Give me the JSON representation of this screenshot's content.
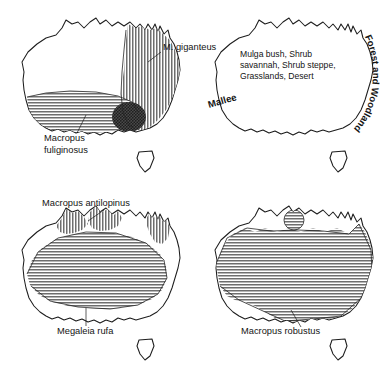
{
  "figure": {
    "background_color": "#ffffff",
    "ink_color": "#1d1d1d",
    "panel_count": 4
  },
  "panels": [
    {
      "id": "kangaroo-east-west",
      "position": "top-left",
      "labels": [
        {
          "name": "m-giganteus",
          "text": "M. giganteus",
          "lines": [
            "M. giganteus"
          ],
          "x": 163,
          "y": 50,
          "anchor": "start",
          "leader": true
        },
        {
          "name": "macropus-fuliginosus",
          "text": "Macropus fuliginosus",
          "lines": [
            "Macropus",
            "fuliginosus"
          ],
          "x": 44,
          "y": 141,
          "anchor": "start",
          "leader": true
        }
      ],
      "regions": [
        {
          "name": "giganteus-range",
          "pattern": "vertical-hatch",
          "color": "#6e6e6e"
        },
        {
          "name": "fuliginosus-range",
          "pattern": "horizontal-hatch",
          "color": "#6e6e6e"
        },
        {
          "name": "range-overlap-blob",
          "pattern": "dark-stipple",
          "color": "#3a3a3a"
        }
      ]
    },
    {
      "id": "vegetation",
      "position": "top-right",
      "labels": [
        {
          "name": "arid-zone-vegetation",
          "text": "Mulga bush, Shrub savannah, Shrub steppe, Grasslands, Desert",
          "lines": [
            "Mulga bush, Shrub",
            "savannah, Shrub steppe,",
            "Grasslands, Desert"
          ],
          "x": 47,
          "y": 57,
          "anchor": "start",
          "leader": false
        },
        {
          "name": "mallee",
          "text": "Mallee",
          "lines": [
            "Mallee"
          ],
          "x": 16,
          "y": 108,
          "anchor": "start",
          "rotate": -16,
          "leader": false
        },
        {
          "name": "forest-and-woodland",
          "text": "Forest and Woodland",
          "lines": [
            "Forest and Woodland"
          ],
          "curved": true,
          "leader": false
        }
      ],
      "regions": [
        {
          "name": "arid-interior",
          "pattern": "white",
          "color": "#ffffff"
        },
        {
          "name": "forest-woodland-belt",
          "pattern": "light-gray",
          "color": "#d7d7d7"
        },
        {
          "name": "mallee-belt",
          "pattern": "mid-gray",
          "color": "#b4b4b4"
        }
      ]
    },
    {
      "id": "antilopinus-rufa",
      "position": "bottom-left",
      "labels": [
        {
          "name": "macropus-antilopinus",
          "text": "Macropus antilopinus",
          "lines": [
            "Macropus antilopinus"
          ],
          "x": 42,
          "y": 18,
          "anchor": "start",
          "leader": true
        },
        {
          "name": "megaleia-rufa",
          "text": "Megaleia rufa",
          "lines": [
            "Megaleia rufa"
          ],
          "x": 57,
          "y": 146,
          "anchor": "start",
          "leader": true
        }
      ],
      "regions": [
        {
          "name": "antilopinus-range",
          "pattern": "vertical-hatch",
          "color": "#6e6e6e"
        },
        {
          "name": "rufa-range",
          "pattern": "horizontal-hatch",
          "color": "#6e6e6e"
        }
      ]
    },
    {
      "id": "robustus",
      "position": "bottom-right",
      "labels": [
        {
          "name": "macropus-robustus",
          "text": "Macropus robustus",
          "lines": [
            "Macropus robustus"
          ],
          "x": 48,
          "y": 146,
          "anchor": "start",
          "leader": true
        }
      ],
      "regions": [
        {
          "name": "robustus-range",
          "pattern": "horizontal-hatch",
          "color": "#6e6e6e"
        },
        {
          "name": "robustus-isolated-patch",
          "pattern": "horizontal-hatch",
          "color": "#6e6e6e"
        }
      ]
    }
  ]
}
